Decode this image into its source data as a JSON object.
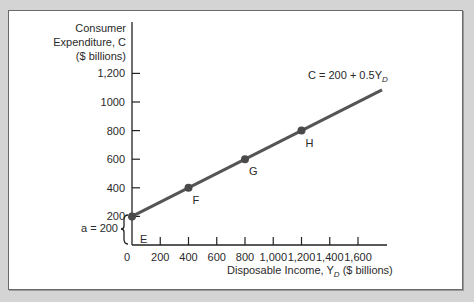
{
  "chart_data": {
    "type": "line",
    "title": "",
    "equation_label": "C = 200 + 0.5Y",
    "equation_subscript": "D",
    "ylabel_lines": [
      "Consumer",
      "Expenditure, C",
      "($ billions)"
    ],
    "xlabel": "Disposable Income, Y",
    "xlabel_subscript": "D",
    "xlabel_suffix": " ($ billions)",
    "x_ticks": [
      "0",
      "200",
      "400",
      "600",
      "800",
      "1,000",
      "1,200",
      "1,400",
      "1,600"
    ],
    "y_ticks": [
      "200",
      "400",
      "600",
      "800",
      "1000",
      "1,200"
    ],
    "xlim": [
      0,
      1800
    ],
    "ylim": [
      0,
      1250
    ],
    "grid": false,
    "series": [
      {
        "name": "C = 200 + 0.5Y_D",
        "x": [
          0,
          1770
        ],
        "y": [
          200,
          1085
        ]
      }
    ],
    "points": [
      {
        "label": "E",
        "x": 0,
        "y": 200
      },
      {
        "label": "F",
        "x": 400,
        "y": 400
      },
      {
        "label": "G",
        "x": 800,
        "y": 600
      },
      {
        "label": "H",
        "x": 1200,
        "y": 800
      }
    ],
    "annotations": [
      {
        "text": "a = 200",
        "note": "brace spanning intercept from 0 to 200"
      }
    ],
    "colors": {
      "line": "#555555",
      "points": "#4a4a4a",
      "text": "#2a2a2a"
    }
  }
}
